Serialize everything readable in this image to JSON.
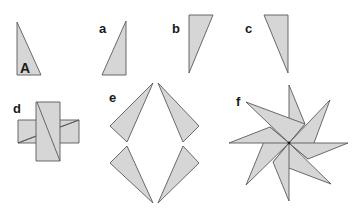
{
  "figure": {
    "fill_color": "#d6d6d6",
    "stroke_color": "#5a5a5a",
    "labels": {
      "A": "A",
      "a": "a",
      "b": "b",
      "c": "c",
      "d": "d",
      "e": "e",
      "f": "f"
    },
    "panels": [
      {
        "id": "A",
        "description": "original right triangle, right angle at bottom-left"
      },
      {
        "id": "a",
        "description": "triangle A reflected horizontally"
      },
      {
        "id": "b",
        "description": "triangle A reflected vertically"
      },
      {
        "id": "c",
        "description": "triangle A rotated 180 degrees"
      },
      {
        "id": "d",
        "description": "two rectangles formed from triangles, overlapping as a cross"
      },
      {
        "id": "e",
        "description": "four triangles arranged in a diamond"
      },
      {
        "id": "f",
        "description": "eight triangles arranged as a pinwheel star"
      }
    ]
  }
}
